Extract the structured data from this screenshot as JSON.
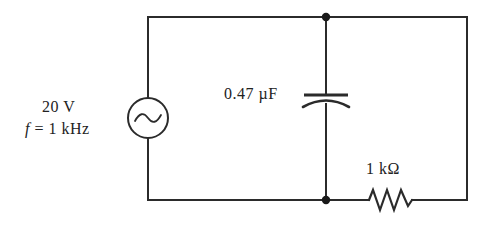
{
  "diagram": {
    "background_color": "#ffffff",
    "line_color": "#2b2b2b"
  },
  "source": {
    "name": "ac-voltage-source",
    "symbol": "sine-wave-circle",
    "voltage_label": "20 V",
    "frequency_symbol": "f",
    "frequency_equals": " = ",
    "frequency_value": "1 kHz",
    "frequency_label": "f = 1 kHz"
  },
  "capacitor": {
    "name": "capacitor",
    "symbol": "curved-plate-capacitor",
    "value_label": "0.47 µF"
  },
  "resistor": {
    "name": "resistor",
    "symbol": "zigzag-resistor",
    "value_label": "1 kΩ"
  },
  "nodes": [
    {
      "name": "top-junction",
      "label": ""
    },
    {
      "name": "bottom-junction",
      "label": ""
    }
  ],
  "wires": [
    {
      "name": "top-wire"
    },
    {
      "name": "left-wire"
    },
    {
      "name": "bottom-wire"
    },
    {
      "name": "right-wire"
    },
    {
      "name": "center-branch-wire"
    }
  ]
}
